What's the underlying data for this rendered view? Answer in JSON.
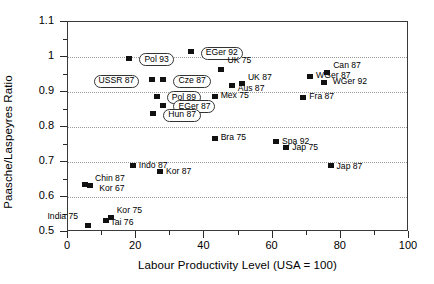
{
  "chart_data": {
    "type": "scatter",
    "title": "",
    "xlabel": "Labour Productivity Level (USA = 100)",
    "ylabel": "Paasche/Laspeyres Ratio",
    "xlim": [
      0,
      100
    ],
    "ylim": [
      0.5,
      1.1
    ],
    "xticks": [
      0,
      20,
      40,
      60,
      80,
      100
    ],
    "xticklabels": [
      "0",
      "20",
      "40",
      "60",
      "80",
      "100"
    ],
    "xminorticks": [
      10,
      30,
      50,
      70,
      90
    ],
    "yticks": [
      0.5,
      0.6,
      0.7,
      0.8,
      0.9,
      1.0,
      1.1
    ],
    "yticklabels": [
      "0.5",
      "0.6",
      "0.7",
      "0.8",
      "0.9",
      "1",
      "1.1"
    ],
    "yminorticks": [
      0.55,
      0.65,
      0.75,
      0.85,
      0.95,
      1.05
    ],
    "grid": "horizontal-dotted",
    "legend": "none",
    "points": [
      {
        "label": "EGer 92",
        "x": 36.0,
        "y": 1.015,
        "boxed": true,
        "lx": 10,
        "ly": -5
      },
      {
        "label": "Pol 93",
        "x": 18.0,
        "y": 0.997,
        "boxed": true,
        "lx": 10,
        "ly": -5
      },
      {
        "label": "USSR 87",
        "x": 24.5,
        "y": 0.935,
        "boxed": true,
        "lx": -58,
        "ly": -5
      },
      {
        "label": "Cze 87",
        "x": 28.0,
        "y": 0.935,
        "boxed": true,
        "lx": 10,
        "ly": -5
      },
      {
        "label": "Pol 89",
        "x": 26.0,
        "y": 0.888,
        "boxed": true,
        "lx": 10,
        "ly": -5
      },
      {
        "label": "EGer 87",
        "x": 28.0,
        "y": 0.862,
        "boxed": true,
        "lx": 10,
        "ly": -5
      },
      {
        "label": "Hun 87",
        "x": 25.0,
        "y": 0.838,
        "boxed": true,
        "lx": 10,
        "ly": -5
      },
      {
        "label": "Mex 75",
        "x": 43.0,
        "y": 0.888,
        "boxed": false,
        "lx": 6,
        "ly": -5
      },
      {
        "label": "UK 75",
        "x": 45.0,
        "y": 0.963,
        "boxed": false,
        "lx": 6,
        "ly": -14
      },
      {
        "label": "Aus 87",
        "x": 48.0,
        "y": 0.918,
        "boxed": false,
        "lx": 6,
        "ly": -2
      },
      {
        "label": "UK 87",
        "x": 51.0,
        "y": 0.925,
        "boxed": false,
        "lx": 6,
        "ly": -10
      },
      {
        "label": "WGer 87",
        "x": 71.0,
        "y": 0.945,
        "boxed": false,
        "lx": 6,
        "ly": -5
      },
      {
        "label": "Can 87",
        "x": 76.0,
        "y": 0.955,
        "boxed": false,
        "lx": 6,
        "ly": -12
      },
      {
        "label": "WGer 92",
        "x": 75.0,
        "y": 0.928,
        "boxed": false,
        "lx": 9,
        "ly": -5
      },
      {
        "label": "Fra 87",
        "x": 69.0,
        "y": 0.885,
        "boxed": false,
        "lx": 6,
        "ly": -5
      },
      {
        "label": "Bra 75",
        "x": 43.0,
        "y": 0.768,
        "boxed": false,
        "lx": 6,
        "ly": -5
      },
      {
        "label": "Spa 92",
        "x": 61.0,
        "y": 0.758,
        "boxed": false,
        "lx": 6,
        "ly": -5
      },
      {
        "label": "Jap 75",
        "x": 64.0,
        "y": 0.742,
        "boxed": false,
        "lx": 6,
        "ly": -4
      },
      {
        "label": "Jap 87",
        "x": 77.0,
        "y": 0.69,
        "boxed": false,
        "lx": 6,
        "ly": -4
      },
      {
        "label": "Indo 87",
        "x": 19.0,
        "y": 0.69,
        "boxed": false,
        "lx": 6,
        "ly": -5
      },
      {
        "label": "Kor 87",
        "x": 27.0,
        "y": 0.672,
        "boxed": false,
        "lx": 6,
        "ly": -5
      },
      {
        "label": "Chin 87",
        "x": 5.0,
        "y": 0.637,
        "boxed": false,
        "lx": 10,
        "ly": -10
      },
      {
        "label": "Kor 67",
        "x": 6.5,
        "y": 0.632,
        "boxed": false,
        "lx": 9,
        "ly": -2
      },
      {
        "label": "India 75",
        "x": 6.0,
        "y": 0.518,
        "boxed": false,
        "lx": -41,
        "ly": -14
      },
      {
        "label": "Tai 76",
        "x": 11.0,
        "y": 0.532,
        "boxed": false,
        "lx": 5,
        "ly": -3
      },
      {
        "label": "Kor 75",
        "x": 12.5,
        "y": 0.542,
        "boxed": false,
        "lx": 6,
        "ly": -11
      }
    ],
    "marker_color": "#111111",
    "grid_color": "#9a9a9a",
    "axis_color": "#3a3a3a"
  }
}
